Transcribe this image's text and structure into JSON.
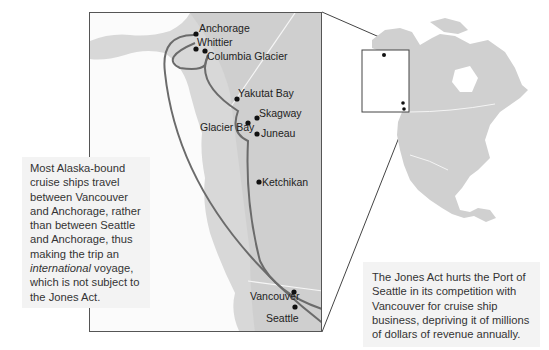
{
  "map": {
    "type": "inset-locator-map",
    "route_color": "#6b6b6b",
    "land_color": "#d2d2d2",
    "inset_land_color": "#cfcfcf",
    "cities": [
      {
        "name": "Anchorage",
        "label": "Anchorage"
      },
      {
        "name": "Whittier",
        "label": "Whittier"
      },
      {
        "name": "Columbia Glacier",
        "label": "Columbia Glacier"
      },
      {
        "name": "Yakutat Bay",
        "label": "Yakutat Bay"
      },
      {
        "name": "Skagway",
        "label": "Skagway"
      },
      {
        "name": "Glacier Bay",
        "label": "Glacier Bay"
      },
      {
        "name": "Juneau",
        "label": "Juneau"
      },
      {
        "name": "Ketchikan",
        "label": "Ketchikan"
      },
      {
        "name": "Vancouver",
        "label": "Vancouver"
      },
      {
        "name": "Seattle",
        "label": "Seattle"
      }
    ]
  },
  "callouts": {
    "left": {
      "before": "Most Alaska-bound cruise ships travel between Vancouver and Anchorage, rather than between Seattle and Anchorage, thus making the trip an ",
      "emphasis": "international",
      "after": " voyage, which is not subject to the Jones Act."
    },
    "right": {
      "text": "The Jones Act hurts the Port of Seattle in its competition with Vancouver for cruise ship business, depriving it of millions of dollars of revenue annually."
    }
  }
}
